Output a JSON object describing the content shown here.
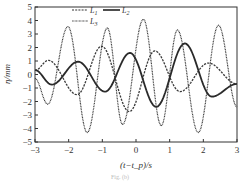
{
  "chart_data": {
    "type": "line",
    "title": "",
    "xlabel": "(t−t_p)/s",
    "ylabel": "η/mm",
    "xlim": [
      -3,
      3
    ],
    "ylim": [
      -5,
      5
    ],
    "x_ticks": [
      -3,
      -2,
      -1,
      0,
      1,
      2,
      3
    ],
    "x_tick_labels": [
      "−3",
      "−2",
      "−1",
      "0",
      "1",
      "2",
      "3"
    ],
    "y_ticks": [
      5,
      4,
      3,
      2,
      1,
      0,
      -1,
      -2,
      -3,
      -4,
      -5
    ],
    "y_tick_labels": [
      "5",
      "4",
      "3",
      "2",
      "1",
      "0",
      "−1",
      "−2",
      "−3",
      "−4",
      "−5"
    ],
    "grid": false,
    "legend": {
      "position": "top-center-left",
      "entries": [
        {
          "name": "L1",
          "sub": "1",
          "style": "dashed"
        },
        {
          "name": "L2",
          "sub": "2",
          "style": "solid"
        },
        {
          "name": "L3",
          "sub": "3",
          "style": "dotted"
        }
      ]
    },
    "series": [
      {
        "name": "L1",
        "style": "dashed",
        "color": "#3a3a3a",
        "x": [
          -3.0,
          -2.6,
          -1.75,
          -1.02,
          -0.2,
          0.56,
          1.31,
          2.15,
          3.0
        ],
        "y": [
          0.3,
          1.05,
          -1.5,
          2.1,
          -2.75,
          1.75,
          -1.27,
          0.85,
          -0.7
        ]
      },
      {
        "name": "L2",
        "style": "solid",
        "color": "#2a2a2a",
        "x": [
          -3.0,
          -2.5,
          -1.72,
          -0.92,
          -0.18,
          0.6,
          1.45,
          2.25,
          3.0
        ],
        "y": [
          0.33,
          -0.75,
          0.95,
          -1.27,
          1.6,
          -2.4,
          2.3,
          -1.64,
          -0.7
        ]
      },
      {
        "name": "L3",
        "style": "dotted",
        "color": "#333333",
        "x": [
          -3.0,
          -2.62,
          -2.02,
          -1.45,
          -0.85,
          -0.4,
          0.22,
          0.75,
          1.23,
          1.85,
          2.45,
          3.0
        ],
        "y": [
          -0.3,
          -2.2,
          3.55,
          -4.3,
          3.45,
          -3.7,
          4.1,
          -3.8,
          3.3,
          -4.3,
          3.65,
          -2.4
        ]
      }
    ]
  },
  "caption": "Fig. (b)"
}
